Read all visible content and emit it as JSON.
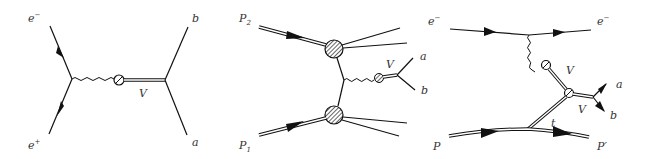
{
  "figure": {
    "type": "feynman-diagrams",
    "background": "#ffffff",
    "line_color": "#111111",
    "panels": [
      {
        "id": "annihilation",
        "labels": {
          "top_left": "e",
          "top_left_sup": "−",
          "bottom_left": "e",
          "bottom_left_sup": "+",
          "propagator": "V",
          "top_right": "b",
          "bottom_right": "a"
        }
      },
      {
        "id": "hadron-collision",
        "labels": {
          "top_left": "P",
          "top_left_sub": "2",
          "bottom_left": "P",
          "bottom_left_sub": "1",
          "boson": "V",
          "decay_top": "a",
          "decay_bottom": "b"
        }
      },
      {
        "id": "electroproduction",
        "labels": {
          "incoming_electron": "e",
          "incoming_electron_sup": "−",
          "outgoing_electron": "e",
          "outgoing_electron_sup": "−",
          "vector_upper": "V",
          "vector_lower": "V",
          "decay_top": "a",
          "decay_bottom": "b",
          "exchange": "t",
          "incoming_proton": "P",
          "outgoing_proton": "P′"
        }
      }
    ]
  }
}
